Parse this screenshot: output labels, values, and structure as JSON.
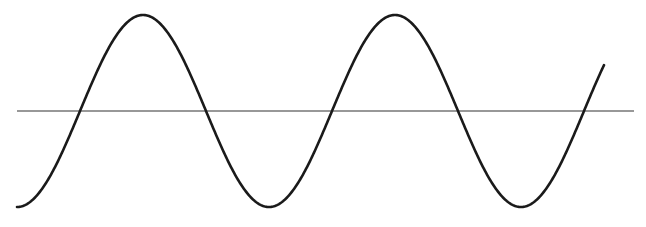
{
  "diagram": {
    "type": "sine-wave",
    "background": "#ffffff",
    "stroke_color": "#1a1a1a",
    "axis_color": "#333333",
    "axis": {
      "x1": 17,
      "x2": 634,
      "y": 111
    },
    "wave": {
      "start_x": 17,
      "end_x": 604,
      "center_y": 111,
      "amplitude": 96,
      "period": 262,
      "phase_start": "trough",
      "zero_crossings_x": [
        80,
        210,
        340,
        472,
        604
      ],
      "peaks_x": [
        147,
        407
      ],
      "troughs_x": [
        17,
        277,
        540
      ]
    }
  }
}
